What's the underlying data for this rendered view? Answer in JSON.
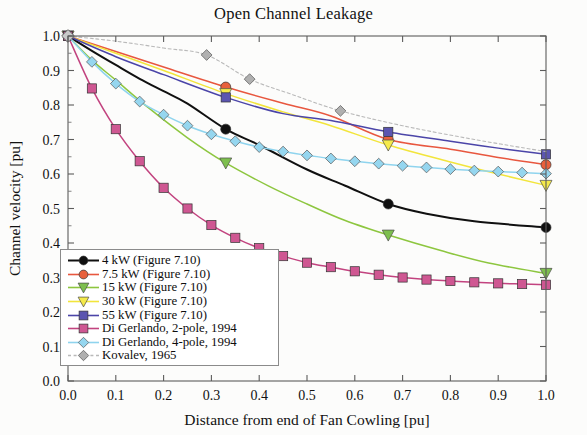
{
  "chart_data": {
    "type": "line",
    "title": "Open Channel Leakage",
    "xlabel": "Distance from end of Fan Cowling [pu]",
    "ylabel": "Channel velocity [pu]",
    "xlim": [
      0.0,
      1.0
    ],
    "ylim": [
      0.0,
      1.0
    ],
    "xticks": [
      "0.0",
      "0.1",
      "0.2",
      "0.3",
      "0.4",
      "0.5",
      "0.6",
      "0.7",
      "0.8",
      "0.9",
      "1.0"
    ],
    "yticks": [
      "0.0",
      "0.1",
      "0.2",
      "0.3",
      "0.4",
      "0.5",
      "0.6",
      "0.7",
      "0.8",
      "0.9",
      "1.0"
    ],
    "grid": false,
    "legend_position": "lower left",
    "series": [
      {
        "name": "4 kW (Figure 7.10)",
        "color": "#101010",
        "marker": "circle",
        "marker_color": "#101010",
        "x": [
          0.0,
          0.05,
          0.1,
          0.15,
          0.2,
          0.25,
          0.33,
          0.4,
          0.5,
          0.58,
          0.67,
          0.75,
          0.85,
          1.0
        ],
        "y": [
          1.0,
          0.957,
          0.916,
          0.876,
          0.84,
          0.804,
          0.73,
          0.684,
          0.613,
          0.566,
          0.513,
          0.485,
          0.463,
          0.445
        ],
        "marker_x": [
          0.0,
          0.33,
          0.67,
          1.0
        ],
        "marker_y": [
          1.0,
          0.73,
          0.513,
          0.445
        ]
      },
      {
        "name": "7.5 kW (Figure 7.10)",
        "color": "#e8573f",
        "marker": "circle",
        "marker_color": "#e8603c",
        "x": [
          0.0,
          0.1,
          0.2,
          0.33,
          0.45,
          0.55,
          0.67,
          0.8,
          0.9,
          1.0
        ],
        "y": [
          1.0,
          0.955,
          0.91,
          0.852,
          0.805,
          0.768,
          0.7,
          0.672,
          0.648,
          0.627
        ],
        "marker_x": [
          0.0,
          0.33,
          0.67,
          1.0
        ],
        "marker_y": [
          1.0,
          0.852,
          0.7,
          0.627
        ]
      },
      {
        "name": "15 kW (Figure 7.10)",
        "color": "#8dc63f",
        "marker": "triangle-down",
        "marker_color": "#7dbf4e",
        "x": [
          0.0,
          0.05,
          0.1,
          0.17,
          0.25,
          0.33,
          0.42,
          0.5,
          0.58,
          0.67,
          0.78,
          0.88,
          1.0
        ],
        "y": [
          1.0,
          0.93,
          0.872,
          0.79,
          0.705,
          0.632,
          0.565,
          0.513,
          0.465,
          0.423,
          0.378,
          0.342,
          0.312
        ],
        "marker_x": [
          0.0,
          0.33,
          0.67,
          1.0
        ],
        "marker_y": [
          1.0,
          0.632,
          0.423,
          0.312
        ]
      },
      {
        "name": "30 kW (Figure 7.10)",
        "color": "#f2e53c",
        "marker": "triangle-down",
        "marker_color": "#f5ea4a",
        "x": [
          0.0,
          0.1,
          0.2,
          0.33,
          0.45,
          0.55,
          0.67,
          0.8,
          0.9,
          1.0
        ],
        "y": [
          1.0,
          0.95,
          0.9,
          0.833,
          0.78,
          0.74,
          0.684,
          0.635,
          0.6,
          0.567
        ],
        "marker_x": [
          0.0,
          0.33,
          0.67,
          1.0
        ],
        "marker_y": [
          1.0,
          0.833,
          0.684,
          0.567
        ]
      },
      {
        "name": "55 kW (Figure 7.10)",
        "color": "#4b45a8",
        "marker": "square",
        "marker_color": "#5b55b0",
        "x": [
          0.0,
          0.1,
          0.2,
          0.33,
          0.45,
          0.55,
          0.67,
          0.8,
          0.9,
          1.0
        ],
        "y": [
          1.0,
          0.94,
          0.888,
          0.822,
          0.775,
          0.755,
          0.722,
          0.695,
          0.675,
          0.657
        ],
        "marker_x": [
          0.0,
          0.33,
          0.67,
          1.0
        ],
        "marker_y": [
          1.0,
          0.822,
          0.722,
          0.657
        ]
      },
      {
        "name": "Di Gerlando, 2-pole, 1994",
        "color": "#c2437f",
        "marker": "square",
        "marker_color": "#cf5792",
        "x": [
          0.0,
          0.05,
          0.1,
          0.15,
          0.2,
          0.25,
          0.3,
          0.35,
          0.4,
          0.45,
          0.5,
          0.55,
          0.6,
          0.65,
          0.7,
          0.75,
          0.8,
          0.85,
          0.9,
          0.95,
          1.0
        ],
        "y": [
          1.0,
          0.848,
          0.73,
          0.637,
          0.56,
          0.5,
          0.452,
          0.415,
          0.385,
          0.362,
          0.343,
          0.33,
          0.318,
          0.308,
          0.3,
          0.294,
          0.29,
          0.286,
          0.283,
          0.281,
          0.279
        ],
        "marker_x": [
          0.0,
          0.05,
          0.1,
          0.15,
          0.2,
          0.25,
          0.3,
          0.35,
          0.4,
          0.45,
          0.5,
          0.55,
          0.6,
          0.65,
          0.7,
          0.75,
          0.8,
          0.85,
          0.9,
          0.95,
          1.0
        ],
        "marker_y": [
          1.0,
          0.848,
          0.73,
          0.637,
          0.56,
          0.5,
          0.452,
          0.415,
          0.385,
          0.362,
          0.343,
          0.33,
          0.318,
          0.308,
          0.3,
          0.294,
          0.29,
          0.286,
          0.283,
          0.281,
          0.279
        ]
      },
      {
        "name": "Di Gerlando, 4-pole, 1994",
        "color": "#8fd4ee",
        "marker": "diamond",
        "marker_color": "#95d6ef",
        "x": [
          0.0,
          0.05,
          0.1,
          0.15,
          0.2,
          0.25,
          0.3,
          0.35,
          0.4,
          0.45,
          0.5,
          0.55,
          0.6,
          0.65,
          0.7,
          0.75,
          0.8,
          0.85,
          0.9,
          0.95,
          1.0
        ],
        "y": [
          1.0,
          0.925,
          0.862,
          0.81,
          0.772,
          0.74,
          0.715,
          0.695,
          0.678,
          0.665,
          0.654,
          0.645,
          0.637,
          0.63,
          0.624,
          0.619,
          0.614,
          0.61,
          0.607,
          0.604,
          0.601
        ],
        "marker_x": [
          0.0,
          0.05,
          0.1,
          0.15,
          0.2,
          0.25,
          0.3,
          0.35,
          0.4,
          0.45,
          0.5,
          0.55,
          0.6,
          0.65,
          0.7,
          0.75,
          0.8,
          0.85,
          0.9,
          0.95,
          1.0
        ],
        "marker_y": [
          1.0,
          0.925,
          0.862,
          0.81,
          0.772,
          0.74,
          0.715,
          0.695,
          0.678,
          0.665,
          0.654,
          0.645,
          0.637,
          0.63,
          0.624,
          0.619,
          0.614,
          0.61,
          0.607,
          0.604,
          0.601
        ]
      },
      {
        "name": "Kovalev, 1965",
        "color": "#b9b9b9",
        "marker": "diamond",
        "marker_color": "#b0b0b0",
        "x": [
          0.0,
          0.1,
          0.2,
          0.29,
          0.38,
          0.47,
          0.57,
          0.7,
          0.85,
          1.0
        ],
        "y": [
          1.0,
          0.985,
          0.965,
          0.945,
          0.875,
          0.83,
          0.783,
          0.74,
          0.7,
          0.665
        ],
        "marker_x": [
          0.0,
          0.29,
          0.38,
          0.57
        ],
        "marker_y": [
          1.0,
          0.945,
          0.875,
          0.783
        ]
      }
    ]
  },
  "legend": {
    "items": [
      {
        "label": "4 kW (Figure 7.10)"
      },
      {
        "label": "7.5 kW (Figure 7.10)"
      },
      {
        "label": "15 kW (Figure 7.10)"
      },
      {
        "label": "30 kW (Figure 7.10)"
      },
      {
        "label": "55 kW (Figure 7.10)"
      },
      {
        "label": "Di Gerlando, 2-pole, 1994"
      },
      {
        "label": "Di Gerlando, 4-pole, 1994"
      },
      {
        "label": "Kovalev, 1965"
      }
    ]
  }
}
